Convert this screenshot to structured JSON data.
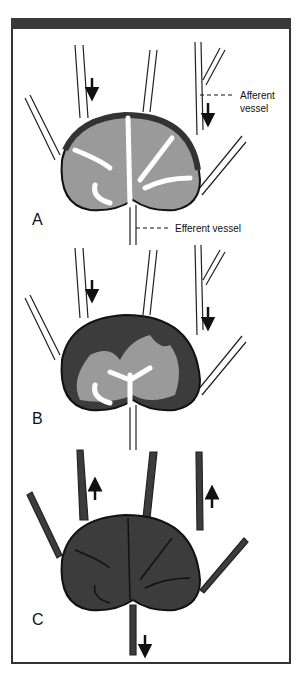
{
  "figure": {
    "panels": [
      {
        "id": "A",
        "label": "A",
        "state": "normal"
      },
      {
        "id": "B",
        "label": "B",
        "state": "filling"
      },
      {
        "id": "C",
        "label": "C",
        "state": "filled-reversed"
      }
    ],
    "annotations": {
      "afferent_line1": "Afferent",
      "afferent_line2": "vessel",
      "efferent": "Efferent vessel"
    },
    "colors": {
      "frame": "#333333",
      "cortex_gray": "#9a9a9a",
      "dark_fill": "#3c3c3c",
      "vessel_white": "#ffffff"
    }
  }
}
